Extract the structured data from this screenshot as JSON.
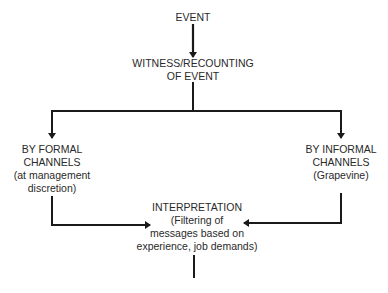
{
  "diagram": {
    "type": "flowchart",
    "nodes": {
      "event": {
        "lines": [
          "EVENT"
        ]
      },
      "witness": {
        "lines": [
          "WITNESS/RECOUNTING",
          "OF EVENT"
        ]
      },
      "formal": {
        "lines": [
          "BY FORMAL",
          "CHANNELS",
          "(at management",
          "discretion)"
        ]
      },
      "informal": {
        "lines": [
          "BY INFORMAL",
          "CHANNELS",
          "(Grapevine)"
        ]
      },
      "interpretation": {
        "lines": [
          "INTERPRETATION",
          "(Filtering of",
          "messages based on",
          "experience, job demands)"
        ]
      }
    },
    "edges": [
      {
        "from": "event",
        "to": "witness",
        "arrow": true
      },
      {
        "from": "witness",
        "to": "formal",
        "arrow": true
      },
      {
        "from": "witness",
        "to": "informal",
        "arrow": true
      },
      {
        "from": "formal",
        "to": "interpretation",
        "arrow": true
      },
      {
        "from": "informal",
        "to": "interpretation",
        "arrow": true
      },
      {
        "from": "interpretation",
        "to": "continues-below",
        "arrow": false
      }
    ],
    "colors": {
      "line": "#1a1a1a",
      "text": "#2a2a2a",
      "background": "#ffffff"
    }
  }
}
